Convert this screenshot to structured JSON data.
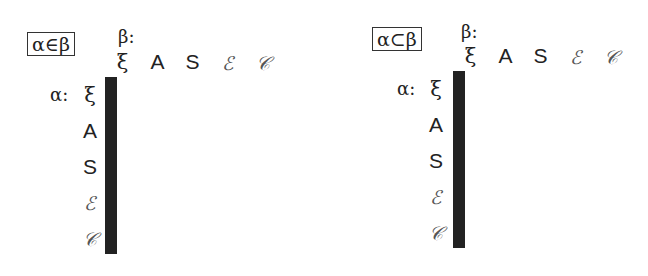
{
  "panels": [
    {
      "title": "α∈β",
      "beta_label": "β:",
      "alpha_label": "α:",
      "columns": [
        "ξ",
        "A",
        "S",
        "ℰ",
        "𝒞"
      ],
      "rows": [
        "ξ",
        "A",
        "S",
        "ℰ",
        "𝒞"
      ]
    },
    {
      "title": "α⊂β",
      "beta_label": "β:",
      "alpha_label": "α:",
      "columns": [
        "ξ",
        "A",
        "S",
        "ℰ",
        "𝒞"
      ],
      "rows": [
        "ξ",
        "A",
        "S",
        "ℰ",
        "𝒞"
      ]
    }
  ]
}
